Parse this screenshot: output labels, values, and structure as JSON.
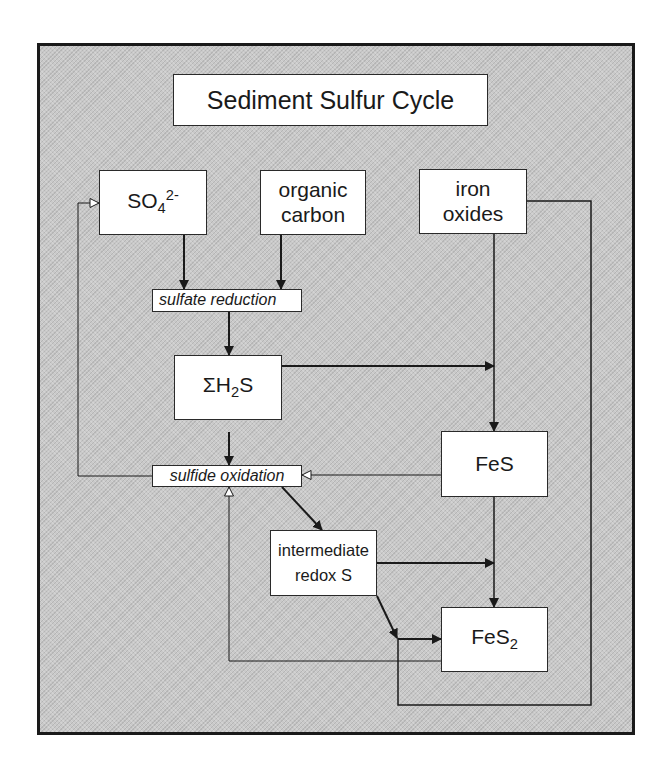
{
  "diagram": {
    "title": "Sediment Sulfur Cycle",
    "nodes": {
      "sulfate": {
        "base": "SO",
        "sub": "4",
        "sup": "2-"
      },
      "organic_carbon": {
        "line1": "organic",
        "line2": "carbon"
      },
      "iron_oxides": {
        "line1": "iron",
        "line2": "oxides"
      },
      "sulfate_reduction": {
        "label": "sulfate reduction"
      },
      "sum_h2s": {
        "prefix": "ΣH",
        "sub": "2",
        "suffix": "S"
      },
      "sulfide_oxidation": {
        "label": "sulfide oxidation"
      },
      "fes": {
        "label": "FeS"
      },
      "intermediate_redox_s": {
        "line1": "intermediate",
        "line2": "redox S"
      },
      "fes2": {
        "base": "FeS",
        "sub": "2"
      }
    },
    "edges": [
      {
        "from": "SO4 2-",
        "to": "sulfate reduction",
        "arrow": "solid"
      },
      {
        "from": "organic carbon",
        "to": "sulfate reduction",
        "arrow": "solid"
      },
      {
        "from": "sulfate reduction",
        "to": "ΣH2S",
        "arrow": "solid"
      },
      {
        "from": "ΣH2S",
        "to": "FeS",
        "arrow": "solid",
        "via": "iron oxides line"
      },
      {
        "from": "iron oxides",
        "to": "FeS",
        "arrow": "solid"
      },
      {
        "from": "ΣH2S",
        "to": "sulfide oxidation",
        "arrow": "solid"
      },
      {
        "from": "sulfide oxidation",
        "to": "SO4 2-",
        "arrow": "hollow"
      },
      {
        "from": "FeS",
        "to": "sulfide oxidation",
        "arrow": "hollow"
      },
      {
        "from": "sulfide oxidation",
        "to": "intermediate redox S",
        "arrow": "solid"
      },
      {
        "from": "intermediate redox S",
        "to": "FeS2",
        "arrow": "solid"
      },
      {
        "from": "FeS",
        "to": "FeS2",
        "arrow": "solid"
      },
      {
        "from": "iron oxides",
        "to": "FeS2",
        "arrow": "solid",
        "via": "outer loop"
      },
      {
        "from": "FeS2",
        "to": "sulfide oxidation",
        "arrow": "hollow"
      }
    ],
    "colors": {
      "background": "#c9c9c9",
      "box_fill": "#ffffff",
      "line": "#1a1a1a"
    }
  }
}
